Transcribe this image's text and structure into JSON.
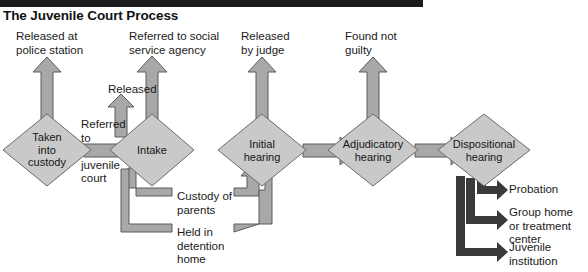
{
  "header": {
    "title": "The Juvenile Court Process",
    "rule_color": "#1c1c1c"
  },
  "colors": {
    "node_fill": "#c9c9c9",
    "node_stroke": "#6b6b6b",
    "arrow_fill": "#a8a8a8",
    "arrow_stroke": "#5a5a5a",
    "dark_arrow": "#3a3a3a",
    "text": "#1a1a1a",
    "page_bg": "#ffffff"
  },
  "nodes": [
    {
      "id": "taken-into-custody",
      "label": "Taken\ninto\ncustody",
      "cx": 47,
      "cy": 150,
      "rx": 44,
      "ry": 36
    },
    {
      "id": "intake",
      "label": "Intake",
      "cx": 152,
      "cy": 150,
      "rx": 42,
      "ry": 36
    },
    {
      "id": "initial-hearing",
      "label": "Initial\nhearing",
      "cx": 262,
      "cy": 150,
      "rx": 44,
      "ry": 36
    },
    {
      "id": "adjudicatory-hearing",
      "label": "Adjudicatory\nhearing",
      "cx": 373,
      "cy": 150,
      "rx": 45,
      "ry": 36
    },
    {
      "id": "dispositional-hearing",
      "label": "Dispositional\nhearing",
      "cx": 484,
      "cy": 150,
      "rx": 46,
      "ry": 36
    }
  ],
  "exit_labels": [
    {
      "id": "released-at-police-station",
      "text": "Released at\npolice station",
      "x": 16,
      "y": 30
    },
    {
      "id": "referred-to-social-service-agency",
      "text": "Referred to social\nservice agency",
      "x": 129,
      "y": 30
    },
    {
      "id": "released",
      "text": "Released",
      "x": 108,
      "y": 83
    },
    {
      "id": "released-by-judge",
      "text": "Released\nby judge",
      "x": 241,
      "y": 30
    },
    {
      "id": "found-not-guilty",
      "text": "Found not\nguilty",
      "x": 345,
      "y": 30
    }
  ],
  "connector_labels": [
    {
      "id": "referred-to-juvenile-court",
      "text": "Referred\nto\n\njuvenile\ncourt",
      "x": 81,
      "y": 118
    },
    {
      "id": "custody-of-parents",
      "text": "Custody of\nparents",
      "x": 177,
      "y": 190
    },
    {
      "id": "held-in-detention-home",
      "text": "Held in\ndetention\nhome",
      "x": 177,
      "y": 226
    }
  ],
  "outcomes": [
    {
      "id": "probation",
      "text": "Probation",
      "x": 509,
      "y": 186
    },
    {
      "id": "group-home-or-treatment-center",
      "text": "Group home\nor treatment\ncenter",
      "x": 509,
      "y": 210
    },
    {
      "id": "juvenile-institution",
      "text": "Juvenile\ninstitution",
      "x": 509,
      "y": 245
    }
  ],
  "flow": {
    "type": "flowchart",
    "sequence": [
      "Taken into custody",
      "Intake",
      "Initial hearing",
      "Adjudicatory hearing",
      "Dispositional hearing"
    ],
    "edges": [
      {
        "from": "Taken into custody",
        "to": "Released at police station",
        "kind": "exit-up"
      },
      {
        "from": "Taken into custody",
        "to": "Intake",
        "kind": "forward",
        "label": "Referred to juvenile court"
      },
      {
        "from": "Intake",
        "to": "Released",
        "kind": "exit-up"
      },
      {
        "from": "Intake",
        "to": "Referred to social service agency",
        "kind": "exit-up"
      },
      {
        "from": "Intake",
        "to": "Initial hearing",
        "kind": "routed",
        "label": "Custody of parents"
      },
      {
        "from": "Intake",
        "to": "Initial hearing",
        "kind": "routed",
        "label": "Held in detention home"
      },
      {
        "from": "Initial hearing",
        "to": "Released by judge",
        "kind": "exit-up"
      },
      {
        "from": "Initial hearing",
        "to": "Adjudicatory hearing",
        "kind": "forward"
      },
      {
        "from": "Adjudicatory hearing",
        "to": "Found not guilty",
        "kind": "exit-up"
      },
      {
        "from": "Adjudicatory hearing",
        "to": "Dispositional hearing",
        "kind": "forward"
      },
      {
        "from": "Dispositional hearing",
        "to": "Probation",
        "kind": "outcome"
      },
      {
        "from": "Dispositional hearing",
        "to": "Group home or treatment center",
        "kind": "outcome"
      },
      {
        "from": "Dispositional hearing",
        "to": "Juvenile institution",
        "kind": "outcome"
      }
    ]
  }
}
